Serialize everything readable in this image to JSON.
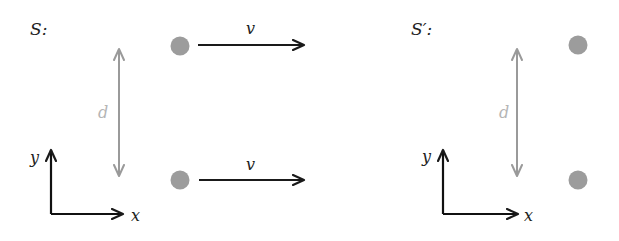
{
  "diagram": {
    "colors": {
      "axis": "#111111",
      "velocity_arrow": "#1a1a1a",
      "distance_arrow": "#9a9a9a",
      "distance_label": "#b5b5b5",
      "particle": "#9c9c9c",
      "label": "#222222"
    },
    "frames": [
      {
        "id": "S",
        "label": "S:",
        "axes": {
          "x_label": "x",
          "y_label": "y"
        },
        "distance_label": "d",
        "particles": [
          {
            "position": "top",
            "velocity_label": "v"
          },
          {
            "position": "bottom",
            "velocity_label": "v"
          }
        ]
      },
      {
        "id": "S_prime",
        "label": "S′:",
        "axes": {
          "x_label": "x",
          "y_label": "y"
        },
        "distance_label": "d",
        "particles": [
          {
            "position": "top"
          },
          {
            "position": "bottom"
          }
        ]
      }
    ]
  }
}
